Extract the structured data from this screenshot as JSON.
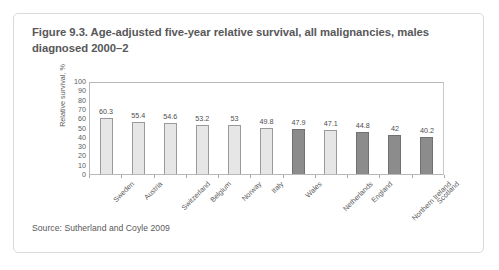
{
  "figure": {
    "title": "Figure 9.3. Age-adjusted five-year relative survival, all malignancies, males diagnosed 2000–2",
    "source": "Source: Sutherland and Coyle 2009"
  },
  "colors": {
    "card_border": "#d9d9d9",
    "title_text": "#58585a",
    "axis_text": "#5c5c5c",
    "bar_light": "#e6e6e6",
    "bar_light_border": "#9a9a9a",
    "bar_dark": "#8c8c8c",
    "bar_dark_border": "#707070",
    "plot_border": "#b8b8b8"
  },
  "chart_data": {
    "type": "bar",
    "title": "Figure 9.3. Age-adjusted five-year relative survival, all malignancies, males diagnosed 2000–2",
    "xlabel": "",
    "ylabel": "Relative survival, %",
    "ylim": [
      0,
      100
    ],
    "ytick_step": 10,
    "ytick_labels": [
      "100",
      "90",
      "80",
      "70",
      "60",
      "50",
      "40",
      "30",
      "20",
      "10",
      "0"
    ],
    "grid": false,
    "legend": "none",
    "orientation": "vertical",
    "categories": [
      "Sweden",
      "Austria",
      "Switzerland",
      "Belgium",
      "Norway",
      "Italy",
      "Wales",
      "Netherlands",
      "England",
      "Northern Ireland",
      "Scotland"
    ],
    "values": [
      60.3,
      55.4,
      54.6,
      53.2,
      53,
      49.8,
      47.9,
      47.1,
      44.8,
      42,
      40.2
    ],
    "value_labels": [
      "60.3",
      "55.4",
      "54.6",
      "53.2",
      "53",
      "49.8",
      "47.9",
      "47.1",
      "44.8",
      "42",
      "40.2"
    ],
    "bar_shades": [
      "light",
      "light",
      "light",
      "light",
      "light",
      "light",
      "dark",
      "light",
      "dark",
      "dark",
      "dark"
    ]
  }
}
